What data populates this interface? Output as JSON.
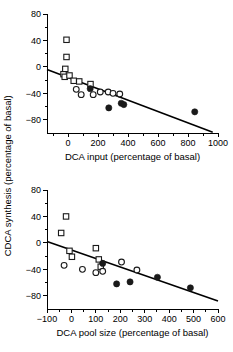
{
  "figure": {
    "shared_ylabel": "CDCA synthesis (percentage of basal)",
    "background": "#ffffff",
    "marker_color": "#1a1a1a"
  },
  "chart_data": [
    {
      "type": "scatter",
      "panel": "top",
      "title": "",
      "xlabel": "DCA input (percentage of basal)",
      "ylabel": "CDCA synthesis (percentage of basal)",
      "xlim": [
        -140,
        1000
      ],
      "ylim": [
        -100,
        80
      ],
      "xticks": [
        0,
        200,
        400,
        600,
        800,
        1000
      ],
      "xticklabels": [
        "0",
        "200",
        "400",
        "600",
        "800",
        "1000"
      ],
      "yticks": [
        -80,
        -40,
        0,
        40,
        80
      ],
      "yticklabels": [
        "−80",
        "−40",
        "0",
        "40",
        "80"
      ],
      "yminorticks": [
        -60,
        -20,
        20,
        60
      ],
      "xminorticks": [
        -100,
        100,
        300,
        500,
        700,
        900
      ],
      "grid": false,
      "legend": false,
      "series": [
        {
          "name": "open squares",
          "marker": "open-square",
          "points": [
            [
              -10,
              41
            ],
            [
              -10,
              15
            ],
            [
              -30,
              -11
            ],
            [
              -18,
              -3
            ],
            [
              -22,
              -15
            ],
            [
              10,
              -13
            ],
            [
              38,
              -21
            ],
            [
              75,
              -22
            ],
            [
              150,
              -26
            ]
          ]
        },
        {
          "name": "open circles",
          "marker": "open-circle",
          "points": [
            [
              55,
              -34
            ],
            [
              88,
              -42
            ],
            [
              168,
              -42
            ],
            [
              215,
              -38
            ],
            [
              268,
              -38
            ],
            [
              300,
              -40
            ],
            [
              345,
              -41
            ]
          ]
        },
        {
          "name": "filled circles",
          "marker": "filled-circle",
          "points": [
            [
              148,
              -33
            ],
            [
              272,
              -62
            ],
            [
              355,
              -55
            ],
            [
              372,
              -57
            ],
            [
              845,
              -68
            ]
          ]
        }
      ],
      "fit_line": {
        "x": [
          -140,
          965
        ],
        "y": [
          -4,
          -99
        ]
      }
    },
    {
      "type": "scatter",
      "panel": "bottom",
      "title": "",
      "xlabel": "DCA pool size (percentage of basal)",
      "ylabel": "CDCA synthesis (percentage of basal)",
      "xlim": [
        -100,
        600
      ],
      "ylim": [
        -100,
        80
      ],
      "xticks": [
        -100,
        0,
        100,
        200,
        300,
        400,
        500,
        600
      ],
      "xticklabels": [
        "−100",
        "0",
        "100",
        "200",
        "300",
        "400",
        "500",
        "600"
      ],
      "yticks": [
        -80,
        -40,
        0,
        40,
        80
      ],
      "yticklabels": [
        "−80",
        "−40",
        "0",
        "40",
        "80"
      ],
      "yminorticks": [
        -60,
        -20,
        20,
        60
      ],
      "xminorticks": [
        -50,
        50,
        150,
        250,
        350,
        450,
        550
      ],
      "grid": false,
      "legend": false,
      "series": [
        {
          "name": "open squares",
          "marker": "open-square",
          "points": [
            [
              -22,
              40
            ],
            [
              -42,
              15
            ],
            [
              -8,
              -12
            ],
            [
              2,
              -21
            ],
            [
              100,
              -8
            ],
            [
              112,
              -25
            ],
            [
              120,
              -36
            ]
          ]
        },
        {
          "name": "open circles",
          "marker": "open-circle",
          "points": [
            [
              -30,
              -34
            ],
            [
              45,
              -40
            ],
            [
              100,
              -45
            ],
            [
              128,
              -43
            ],
            [
              205,
              -29
            ],
            [
              268,
              -41
            ]
          ]
        },
        {
          "name": "filled circles",
          "marker": "filled-circle",
          "points": [
            [
              128,
              -31
            ],
            [
              185,
              -62
            ],
            [
              240,
              -59
            ],
            [
              352,
              -52
            ],
            [
              487,
              -68
            ]
          ]
        }
      ],
      "fit_line": {
        "x": [
          -100,
          600
        ],
        "y": [
          2,
          -88
        ]
      }
    }
  ]
}
